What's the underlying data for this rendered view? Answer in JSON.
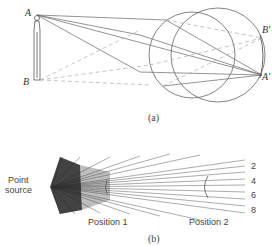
{
  "figure_a": {
    "caption": "(a)",
    "point_labels": {
      "object_top": "A",
      "object_bottom": "B",
      "image_top": "B'",
      "image_bottom": "A'"
    }
  },
  "figure_b": {
    "caption": "(b)",
    "source_label_line1": "Point",
    "source_label_line2": "source",
    "position_labels": [
      "Position 1",
      "Position 2"
    ],
    "ray_numbers": [
      "2",
      "4",
      "6",
      "8"
    ]
  },
  "colors": {
    "line": "#555555",
    "dashed": "#aaaaaa",
    "text": "#333333"
  }
}
